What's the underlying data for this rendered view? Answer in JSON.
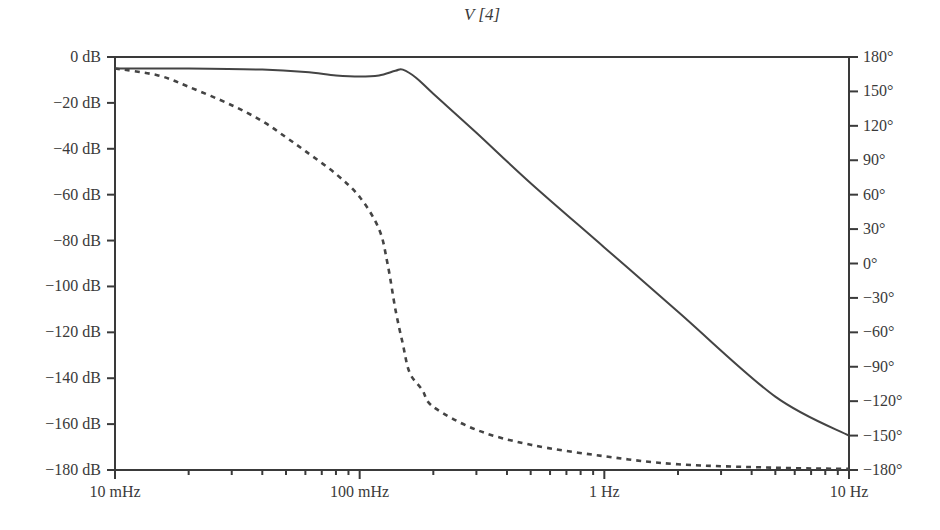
{
  "chart_data": {
    "type": "line",
    "title": "V [4]",
    "xlabel": "",
    "ylabel": "",
    "xscale": "log",
    "x_range_hz": [
      0.01,
      10
    ],
    "x_tick_labels": [
      "10 mHz",
      "100 mHz",
      "1 Hz",
      "10 Hz"
    ],
    "x_tick_values_hz": [
      0.01,
      0.1,
      1,
      10
    ],
    "y_left": {
      "unit": "dB",
      "range": [
        -180,
        0
      ],
      "tick_labels": [
        "0 dB",
        "−20 dB",
        "−40 dB",
        "−60 dB",
        "−80 dB",
        "−100 dB",
        "−120 dB",
        "−140 dB",
        "−160 dB",
        "−180 dB"
      ],
      "tick_values": [
        0,
        -20,
        -40,
        -60,
        -80,
        -100,
        -120,
        -140,
        -160,
        -180
      ]
    },
    "y_right": {
      "unit": "deg",
      "range": [
        -180,
        180
      ],
      "tick_labels": [
        "180°",
        "150°",
        "120°",
        "90°",
        "60°",
        "30°",
        "0°",
        "−30°",
        "−60°",
        "−90°",
        "−120°",
        "−150°",
        "−180°"
      ],
      "tick_values": [
        180,
        150,
        120,
        90,
        60,
        30,
        0,
        -30,
        -60,
        -90,
        -120,
        -150,
        -180
      ]
    },
    "grid": false,
    "legend": null,
    "series": [
      {
        "name": "Magnitude",
        "axis": "left",
        "style": "solid",
        "x": [
          0.01,
          0.02,
          0.04,
          0.06,
          0.08,
          0.1,
          0.12,
          0.14,
          0.15,
          0.17,
          0.2,
          0.3,
          0.5,
          1,
          2,
          5,
          10
        ],
        "values": [
          -5,
          -5,
          -5.5,
          -6.5,
          -8,
          -8.5,
          -8,
          -6,
          -5.5,
          -9,
          -16,
          -33,
          -55,
          -83,
          -111,
          -148,
          -165
        ]
      },
      {
        "name": "Phase",
        "axis": "right",
        "style": "dashed",
        "x": [
          0.01,
          0.015,
          0.02,
          0.03,
          0.04,
          0.05,
          0.06,
          0.08,
          0.1,
          0.12,
          0.13,
          0.14,
          0.15,
          0.16,
          0.18,
          0.2,
          0.3,
          0.5,
          1,
          2,
          5,
          10
        ],
        "values": [
          170,
          164,
          154,
          138,
          124,
          110,
          98,
          78,
          58,
          30,
          0,
          -40,
          -70,
          -95,
          -110,
          -125,
          -145,
          -158,
          -168,
          -175,
          -178,
          -179
        ]
      }
    ]
  }
}
